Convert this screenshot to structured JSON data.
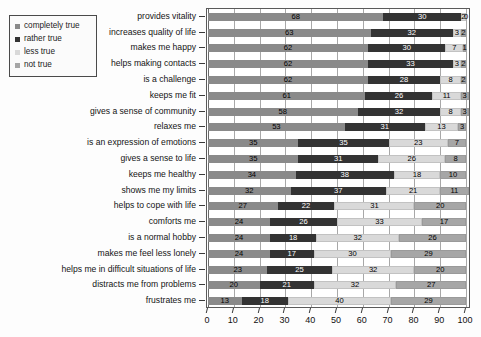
{
  "legend": {
    "name": "legend",
    "items": [
      {
        "label": "completely true",
        "color": "#8a8a8a",
        "swatch": "swatch-completely-true"
      },
      {
        "label": "rather true",
        "color": "#333333",
        "swatch": "swatch-rather-true"
      },
      {
        "label": "less true",
        "color": "#d9d9d9",
        "swatch": "swatch-less-true"
      },
      {
        "label": "not true",
        "color": "#a6a6a6",
        "swatch": "swatch-not-true"
      }
    ]
  },
  "axis": {
    "x_ticks": [
      0,
      10,
      20,
      30,
      40,
      50,
      60,
      70,
      80,
      90,
      100
    ],
    "x_min": 0,
    "x_max": 100
  },
  "chart_data": {
    "type": "bar",
    "orientation": "horizontal",
    "stacked": true,
    "normalized_percent": true,
    "title": "",
    "subtitle": "",
    "xlabel": "",
    "ylabel": "",
    "xlim": [
      0,
      100
    ],
    "xticks": [
      0,
      10,
      20,
      30,
      40,
      50,
      60,
      70,
      80,
      90,
      100
    ],
    "grid": true,
    "grid_axis": "x",
    "legend_position": "top-left-outside",
    "categories": [
      "provides vitality",
      "increases quality of life",
      "makes me happy",
      "helps making contacts",
      "is a challenge",
      "keeps me fit",
      "gives a sense of community",
      "relaxes me",
      "is an expression of emotions",
      "gives a sense to life",
      "keeps me healthy",
      "shows me my limits",
      "helps to cope with life",
      "comforts me",
      "is a normal hobby",
      "makes me feel less lonely",
      "helps me in difficult situations of life",
      "distracts me from problems",
      "frustrates me"
    ],
    "series": [
      {
        "name": "completely true",
        "color": "#8a8a8a",
        "values": [
          68,
          63,
          62,
          62,
          62,
          61,
          58,
          53,
          35,
          35,
          34,
          32,
          27,
          24,
          24,
          24,
          23,
          20,
          13
        ]
      },
      {
        "name": "rather true",
        "color": "#333333",
        "values": [
          30,
          32,
          30,
          33,
          28,
          26,
          32,
          31,
          35,
          31,
          38,
          37,
          22,
          26,
          18,
          17,
          25,
          21,
          18
        ]
      },
      {
        "name": "less true",
        "color": "#d9d9d9",
        "values": [
          2,
          3,
          7,
          3,
          8,
          11,
          8,
          13,
          23,
          26,
          18,
          21,
          31,
          33,
          32,
          30,
          32,
          32,
          40
        ]
      },
      {
        "name": "not true",
        "color": "#a6a6a6",
        "values": [
          0,
          2,
          1,
          2,
          2,
          3,
          3,
          3,
          7,
          8,
          10,
          11,
          20,
          17,
          26,
          29,
          20,
          27,
          29
        ]
      }
    ]
  }
}
